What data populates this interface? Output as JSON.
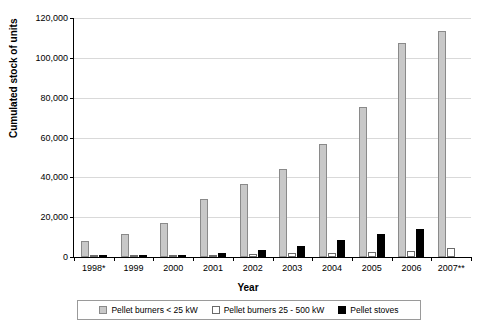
{
  "chart_data": {
    "type": "bar",
    "title": "",
    "xlabel": "Year",
    "ylabel": "Cumulated stock of units",
    "ylim": [
      0,
      120000
    ],
    "ytick_labels": [
      "0",
      "20,000",
      "40,000",
      "60,000",
      "80,000",
      "100,000",
      "120,000"
    ],
    "ytick_values": [
      0,
      20000,
      40000,
      60000,
      80000,
      100000,
      120000
    ],
    "grid": true,
    "legend_position": "bottom",
    "categories": [
      "1998*",
      "1999",
      "2000",
      "2001",
      "2002",
      "2003",
      "2004",
      "2005",
      "2006",
      "2007**"
    ],
    "series": [
      {
        "name": "Pellet burners < 25 kW",
        "color": "#c8c8c8",
        "values": [
          8000,
          11500,
          17000,
          29000,
          36500,
          44000,
          56500,
          75500,
          107500,
          113500
        ]
      },
      {
        "name": "Pellet burners 25 - 500 kW",
        "color": "#ffffff",
        "values": [
          300,
          500,
          800,
          1200,
          1500,
          1800,
          2100,
          2500,
          3200,
          4500
        ]
      },
      {
        "name": "Pellet stoves",
        "color": "#000000",
        "values": [
          200,
          400,
          1000,
          2000,
          3500,
          5500,
          8500,
          11500,
          14000,
          0
        ]
      }
    ]
  },
  "legend": {
    "items": [
      {
        "label": "Pellet burners < 25 kW",
        "swatch": "s0"
      },
      {
        "label": "Pellet burners 25 - 500 kW",
        "swatch": "s1"
      },
      {
        "label": "Pellet stoves",
        "swatch": "s2"
      }
    ]
  }
}
